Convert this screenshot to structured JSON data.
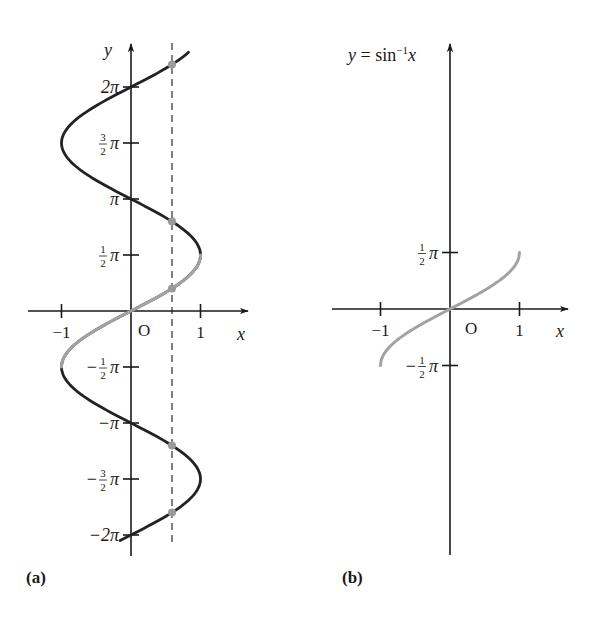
{
  "figure": {
    "panels": [
      {
        "id": "a",
        "label": "(a)",
        "axis_x_label": "x",
        "axis_y_label": "y",
        "origin_label": "O",
        "x_ticks": [
          {
            "value": -1,
            "label": "−1"
          },
          {
            "value": 1,
            "label": "1"
          }
        ],
        "y_ticks": [
          {
            "value_pi": 2,
            "label": "2π"
          },
          {
            "value_pi": 1.5,
            "label_num": "3",
            "label_den": "2",
            "label_suffix": "π",
            "sign": ""
          },
          {
            "value_pi": 1,
            "label": "π"
          },
          {
            "value_pi": 0.5,
            "label_num": "1",
            "label_den": "2",
            "label_suffix": "π",
            "sign": ""
          },
          {
            "value_pi": -0.5,
            "label_num": "1",
            "label_den": "2",
            "label_suffix": "π",
            "sign": "−"
          },
          {
            "value_pi": -1,
            "label": "−π"
          },
          {
            "value_pi": -1.5,
            "label_num": "3",
            "label_den": "2",
            "label_suffix": "π",
            "sign": "−"
          },
          {
            "value_pi": -2,
            "label": "−2π"
          }
        ],
        "dashed_line_x": 0.59
      },
      {
        "id": "b",
        "label": "(b)",
        "title": "y = sin⁻¹x",
        "title_parts": {
          "y": "y",
          "eq": " = sin",
          "sup": "−1",
          "x": "x"
        },
        "axis_x_label": "x",
        "origin_label": "O",
        "x_ticks": [
          {
            "value": -1,
            "label": "−1"
          },
          {
            "value": 1,
            "label": "1"
          }
        ],
        "y_ticks": [
          {
            "value_pi": 0.5,
            "label_num": "1",
            "label_den": "2",
            "label_suffix": "π",
            "sign": ""
          },
          {
            "value_pi": -0.5,
            "label_num": "1",
            "label_den": "2",
            "label_suffix": "π",
            "sign": "−"
          }
        ]
      }
    ],
    "colors": {
      "ink": "#1a1a1a",
      "curve_dark": "#222222",
      "curve_gray": "#a3a3a3",
      "dot_gray": "#9a9a9a"
    }
  },
  "chart_data": [
    {
      "type": "line",
      "title": "(a) x = sin y",
      "xlabel": "x",
      "ylabel": "y",
      "xlim": [
        -1.2,
        1.6
      ],
      "ylim_pi": [
        -2.05,
        2.31
      ],
      "series": [
        {
          "name": "x = sin y (full)",
          "color": "#222222",
          "y_range_pi": [
            -2.05,
            2.31
          ]
        },
        {
          "name": "principal branch",
          "color": "#a3a3a3",
          "y_range_pi": [
            -0.5,
            0.5
          ]
        }
      ],
      "dashed_vertical": {
        "x": 0.59
      },
      "intersection_points_y": [
        6.914,
        2.511,
        0.631,
        -3.773,
        -5.652
      ]
    },
    {
      "type": "line",
      "title": "(b) y = sin⁻¹x",
      "xlabel": "x",
      "ylabel": "y",
      "xlim": [
        -1.7,
        1.7
      ],
      "ylim_pi": [
        -2.2,
        2.3
      ],
      "series": [
        {
          "name": "y = arcsin x",
          "color": "#a3a3a3",
          "x_range": [
            -1,
            1
          ]
        }
      ]
    }
  ]
}
